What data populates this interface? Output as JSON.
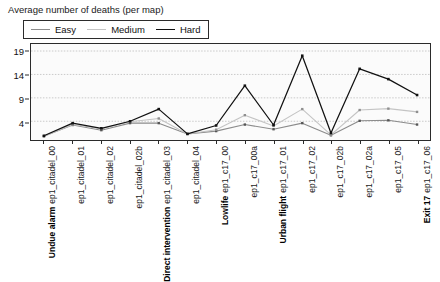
{
  "chart_title": "Average number of deaths (per map)",
  "legend": {
    "position": "top-left",
    "items": [
      {
        "label": "Easy",
        "color": "#8c8c8c"
      },
      {
        "label": "Medium",
        "color": "#c4c4c4"
      },
      {
        "label": "Hard",
        "color": "#111111"
      }
    ]
  },
  "axes": {
    "y_ticks": [
      "4",
      "9",
      "14",
      "19"
    ],
    "y_tick_values": [
      4,
      9,
      14,
      19
    ]
  },
  "group_headers": [
    {
      "label": "Undue alarm",
      "at_index": 0
    },
    {
      "label": "Direct intervention",
      "at_index": 4
    },
    {
      "label": "Lowlife",
      "at_index": 6
    },
    {
      "label": "Urban flight",
      "at_index": 8
    },
    {
      "label": "Exit 17",
      "at_index": 13
    }
  ],
  "chart_data": {
    "type": "line",
    "title": "Average number of deaths (per map)",
    "xlabel": "",
    "ylabel": "",
    "ylim": [
      0,
      20.5
    ],
    "grid": true,
    "legend_position": "top-left",
    "categories": [
      "ep1_citadel_00",
      "ep1_citadel_01",
      "ep1_citadel_02",
      "ep1_citadel_02b",
      "ep1_citadel_03",
      "ep1_citadel_04",
      "ep1_c17_00",
      "ep1_c17_00a",
      "ep1_c17_01",
      "ep1_c17_02",
      "ep1_c17_02b",
      "ep1_c17_02a",
      "ep1_c17_05",
      "ep1_c17_06"
    ],
    "series": [
      {
        "name": "Easy",
        "color": "#8c8c8c",
        "values": [
          0.8,
          3.2,
          2.1,
          3.6,
          3.6,
          1.3,
          1.9,
          3.3,
          2.3,
          3.6,
          1.0,
          4.1,
          4.2,
          3.3
        ]
      },
      {
        "name": "Medium",
        "color": "#c4c4c4",
        "values": [
          0.8,
          3.3,
          2.4,
          3.9,
          4.6,
          1.3,
          2.2,
          5.3,
          3.0,
          6.6,
          1.1,
          6.4,
          6.7,
          6.0
        ]
      },
      {
        "name": "Hard",
        "color": "#111111",
        "values": [
          0.9,
          3.6,
          2.5,
          4.0,
          6.6,
          1.3,
          3.1,
          11.6,
          3.2,
          18.0,
          1.5,
          15.2,
          13.0,
          9.6
        ]
      }
    ]
  }
}
